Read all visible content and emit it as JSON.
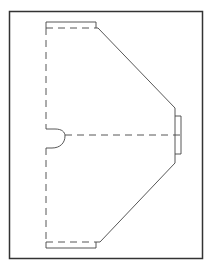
{
  "diagram": {
    "type": "dieline",
    "colors": {
      "background": "#ffffff",
      "frame": "#333333",
      "cut_line": "#444444",
      "fold_line": "#444444"
    },
    "line_styles": {
      "cut": "solid",
      "fold": "dashed"
    }
  }
}
